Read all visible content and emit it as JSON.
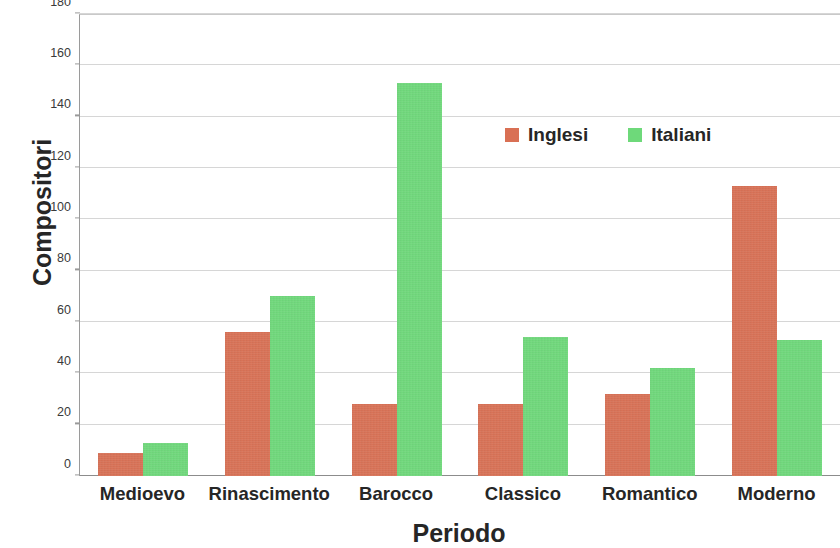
{
  "chart_data": {
    "type": "bar",
    "title": "",
    "xlabel": "Periodo",
    "ylabel": "Compositori",
    "categories": [
      "Medioevo",
      "Rinascimento",
      "Barocco",
      "Classico",
      "Romantico",
      "Moderno"
    ],
    "series": [
      {
        "name": "Inglesi",
        "color": "#d97054",
        "values": [
          9,
          56,
          28,
          28,
          32,
          113
        ]
      },
      {
        "name": "Italiani",
        "color": "#6ed97a",
        "values": [
          13,
          70,
          153,
          54,
          42,
          53
        ]
      }
    ],
    "ylim": [
      0,
      180
    ],
    "yticks": [
      0,
      20,
      40,
      60,
      80,
      100,
      120,
      140,
      160,
      180
    ],
    "ytick_labels": [
      "0",
      "20",
      "40",
      "60",
      "80",
      "100",
      "120",
      "140",
      "160",
      "180"
    ],
    "grid": true,
    "grid_axis": "y",
    "legend_position": "upper center",
    "legend": [
      "Inglesi",
      "Italiani"
    ],
    "bar_group_mode": "grouped",
    "background_color": "#ffffff",
    "axis_color": "#9a9a9a",
    "gridline_color": "#d6d6d6"
  }
}
